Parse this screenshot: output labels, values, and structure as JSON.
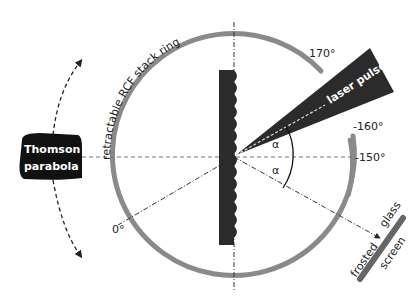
{
  "diagram": {
    "ring_label": "retractable RCF stack ring",
    "laser_label": "laser pulse",
    "thomson_line1": "Thomson",
    "thomson_line2": "parabola",
    "angle_170": "170°",
    "angle_m160": "-160°",
    "angle_m150": "-150°",
    "angle_0": "0°",
    "alpha": "α",
    "screen_top": "glass",
    "screen_left": "frosted",
    "screen_bottom": "screen",
    "colors": {
      "ring": "#8a8a8a",
      "dark": "#2b2b2b",
      "line": "#333333"
    }
  }
}
